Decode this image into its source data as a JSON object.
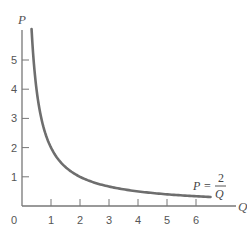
{
  "chart_data": {
    "type": "line",
    "title": "",
    "xlabel": "Q",
    "ylabel": "P",
    "origin_label": "0",
    "xlim": [
      0,
      6.6
    ],
    "ylim": [
      0,
      6
    ],
    "x_ticks": [
      "1",
      "2",
      "3",
      "4",
      "5",
      "6"
    ],
    "y_ticks": [
      "1",
      "2",
      "3",
      "4",
      "5"
    ],
    "grid": false,
    "legend": "none",
    "series": [
      {
        "name": "P = 2/Q",
        "function": "P = 2/Q",
        "x": [
          0.33,
          0.4,
          0.5,
          0.75,
          1,
          1.5,
          2,
          2.5,
          3,
          4,
          5,
          6,
          6.5
        ],
        "values": [
          6.0,
          5.0,
          4.0,
          2.67,
          2.0,
          1.33,
          1.0,
          0.8,
          0.67,
          0.5,
          0.4,
          0.33,
          0.31
        ]
      }
    ],
    "annotations": [
      {
        "text": "P = 2/Q",
        "lhs": "P",
        "equals": "=",
        "numerator": "2",
        "denominator": "Q",
        "position": "near curve end, x≈6"
      }
    ],
    "colors": {
      "curve": "#6e6e6e",
      "axis": "#777777",
      "text": "#555555"
    }
  }
}
